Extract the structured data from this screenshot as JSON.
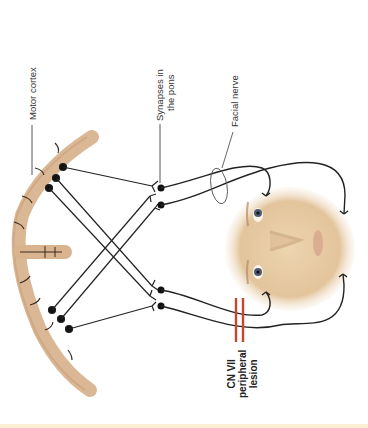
{
  "figure": {
    "labels": {
      "motor_cortex": "Motor cortex",
      "synapses_line1": "Synapses in",
      "synapses_line2": "the pons",
      "facial_nerve": "Facial nerve",
      "lesion_line1": "CN VII",
      "lesion_line2": "peripheral",
      "lesion_line3": "lesion"
    },
    "colors": {
      "cortex": "#d9b48f",
      "cortex_edge": "#c59a72",
      "nerve_line": "#222222",
      "lesion": "#c8462b",
      "skin": "#e8cfa8",
      "bottom_band": "#fcefd6",
      "label_text": "#333333"
    }
  }
}
